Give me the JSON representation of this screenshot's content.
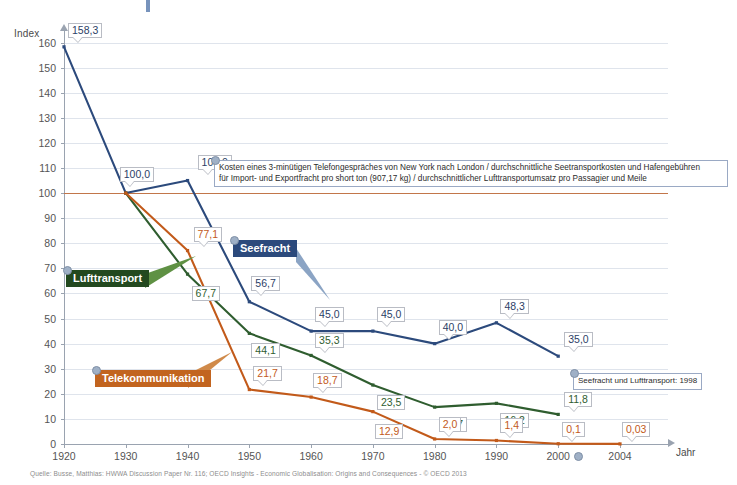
{
  "axes": {
    "y_title": "Index",
    "x_title": "Jahr",
    "y_ticks": [
      "0",
      "10",
      "20",
      "30",
      "40",
      "50",
      "60",
      "70",
      "80",
      "90",
      "100",
      "110",
      "120",
      "130",
      "140",
      "150",
      "160"
    ],
    "x_ticks": [
      "1920",
      "1930",
      "1940",
      "1950",
      "1960",
      "1970",
      "1980",
      "1990",
      "2000",
      "2004"
    ]
  },
  "series_tags": [
    {
      "key": "sea",
      "label": "Seefracht",
      "color": "#2c4a7c"
    },
    {
      "key": "air",
      "label": "Lufttransport",
      "color": "#23491f"
    },
    {
      "key": "tel",
      "label": "Telekommunikation",
      "color": "#c2641f"
    }
  ],
  "notes": {
    "footnote1_line1": "Kosten eines 3-minütigen Telefongespräches von New York nach London / durchschnittliche Seetransportkosten und Hafengebühren",
    "footnote1_line2": "für Import- und Exportfracht pro short ton (907,17 kg) / durchschnittlicher Lufttransportumsatz pro Passagier und Meile",
    "footnote2": "Seefracht und Lufttransport: 1998"
  },
  "source": "Quelle: Busse, Matthias: HWWA Discussion Paper Nr. 116; OECD Insights - Economic Globalisation: Origins and Consequences - © OECD 2013",
  "chart_data": {
    "type": "line",
    "title": "",
    "xlabel": "Jahr",
    "ylabel": "Index",
    "ylim": [
      0,
      165
    ],
    "grid": true,
    "legend_position": "inline-callouts",
    "x": [
      1920,
      1930,
      1940,
      1950,
      1960,
      1970,
      1980,
      1990,
      2000,
      2004
    ],
    "reference_line": {
      "value": 100,
      "color": "#c2764a"
    },
    "series": [
      {
        "name": "Seefracht",
        "color": "#2c4a7c",
        "x": [
          1920,
          1930,
          1940,
          1950,
          1960,
          1970,
          1980,
          1990,
          2000
        ],
        "values": [
          158.3,
          100.0,
          105.0,
          56.7,
          45.0,
          45.0,
          40.0,
          48.3,
          35.0
        ],
        "labels": [
          "158,3",
          "100,0",
          "105,0",
          "56,7",
          "45,0",
          "45,0",
          "40,0",
          "48,3",
          "35,0"
        ]
      },
      {
        "name": "Lufttransport",
        "color": "#2f5d2f",
        "x": [
          1930,
          1940,
          1950,
          1960,
          1970,
          1980,
          1990,
          2000
        ],
        "values": [
          100.0,
          67.7,
          44.1,
          35.3,
          23.5,
          14.7,
          16.2,
          11.8
        ],
        "labels": [
          "100,0",
          "67,7",
          "44,1",
          "35,3",
          "23,5",
          "14,7",
          "16,2",
          "11,8"
        ]
      },
      {
        "name": "Telekommunikation",
        "color": "#c25a1a",
        "x": [
          1930,
          1940,
          1950,
          1960,
          1970,
          1980,
          1990,
          2000,
          2004
        ],
        "values": [
          100.0,
          77.1,
          21.7,
          18.7,
          12.9,
          2.0,
          1.4,
          0.1,
          0.03
        ],
        "labels": [
          "100,0",
          "77,1",
          "21,7",
          "18,7",
          "12,9",
          "2,0",
          "1,4",
          "0,1",
          "0,03"
        ]
      }
    ]
  }
}
